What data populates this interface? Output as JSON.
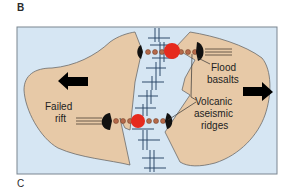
{
  "panels": {
    "top_label": "B",
    "bottom_label": "C"
  },
  "labels": {
    "flood_basalts": [
      "Flood",
      "basalts"
    ],
    "failed_rift": [
      "Failed",
      "rift"
    ],
    "volcanic_ridges": [
      "Volcanic",
      "aseismic",
      "ridges"
    ]
  },
  "colors": {
    "ocean": "#d6e6f3",
    "continent": "#e7c9a7",
    "outline": "#6b6b6b",
    "ridge_line": "#2e4a6b",
    "hotspot": "#e62a1e",
    "seamount": "#b5694a",
    "plume_head": "#111111",
    "arrow": "#000000"
  },
  "icons": {
    "left_arrow": "arrow-left-icon",
    "right_arrow": "arrow-right-icon"
  }
}
